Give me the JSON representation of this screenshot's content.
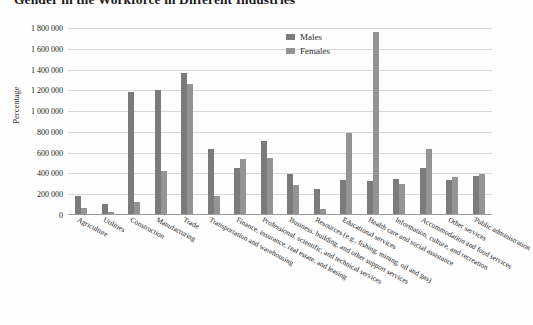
{
  "chart_data": {
    "type": "bar",
    "title": "Gender in the Workforce in Different Industries",
    "xlabel": "",
    "ylabel": "Percentage",
    "ylim": [
      0,
      1800000
    ],
    "ytick_labels": [
      "1 800 000",
      "1 600 000",
      "1 400 000",
      "1 200 000",
      "1 000 000",
      "800 000",
      "600 000",
      "400 000",
      "200 000",
      "0"
    ],
    "ytick_values": [
      1800000,
      1600000,
      1400000,
      1200000,
      1000000,
      800000,
      600000,
      400000,
      200000,
      0
    ],
    "grid": true,
    "legend_position": "top-center-right",
    "categories": [
      "Agriculture",
      "Utilities",
      "Construction",
      "Manufacturing",
      "Trade",
      "Transportation and warehousing",
      "Finance, insurance, real estate, and leasing",
      "Professional, scientific, and technical services",
      "Business, building, and other support services",
      "Resources (e.g., fishing, mining, oil and gas)",
      "Educational services",
      "Health care and social assistance",
      "Information, culture, and recreation",
      "Accommodation and food services",
      "Other services",
      "Public administration"
    ],
    "series": [
      {
        "name": "Males",
        "color": "#7b7b7b",
        "values": [
          180000,
          110000,
          1180000,
          1200000,
          1370000,
          640000,
          450000,
          710000,
          390000,
          250000,
          340000,
          330000,
          350000,
          450000,
          340000,
          380000
        ]
      },
      {
        "name": "Females",
        "color": "#949494",
        "values": [
          70000,
          25000,
          130000,
          420000,
          1260000,
          180000,
          540000,
          550000,
          290000,
          55000,
          790000,
          1760000,
          300000,
          640000,
          370000,
          395000
        ]
      }
    ]
  },
  "legend": {
    "items": [
      {
        "label": "Males"
      },
      {
        "label": "Females"
      }
    ]
  }
}
